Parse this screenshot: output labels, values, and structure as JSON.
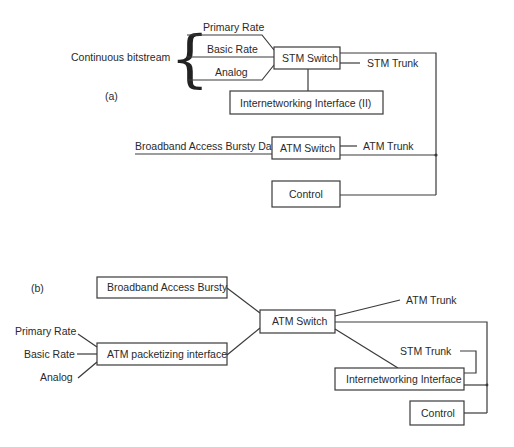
{
  "diagram_a": {
    "label": "(a)",
    "group_label": "Continuous bitstream",
    "inputs": [
      "Primary Rate",
      "Basic Rate",
      "Analog"
    ],
    "stm_switch": "STM Switch",
    "stm_trunk": "STM Trunk",
    "interworking": "Internetworking Interface (II)",
    "broadband_input": "Broadband Access Bursty Data",
    "atm_switch": "ATM Switch",
    "atm_trunk": "ATM Trunk",
    "control": "Control"
  },
  "diagram_b": {
    "label": "(b)",
    "broadband_box": "Broadband Access Bursty",
    "inputs": [
      "Primary Rate",
      "Basic Rate",
      "Analog"
    ],
    "packetizer": "ATM packetizing interface",
    "atm_switch": "ATM Switch",
    "atm_trunk": "ATM Trunk",
    "stm_trunk": "STM Trunk",
    "interworking": "Internetworking Interface",
    "control": "Control"
  }
}
